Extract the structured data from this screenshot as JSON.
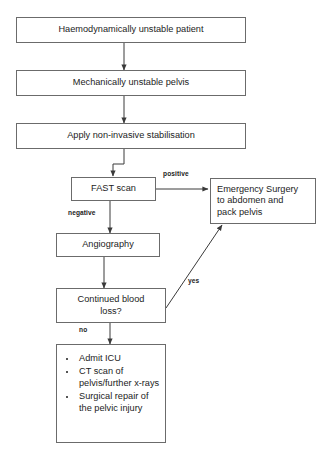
{
  "diagram": {
    "type": "flowchart",
    "colors": {
      "box_border": "#6b6b6b",
      "text": "#1c1c1c",
      "background": "#ffffff",
      "connector": "#3a3a3a"
    },
    "nodes": [
      {
        "id": "n1",
        "label": "Haemodynamically unstable patient"
      },
      {
        "id": "n2",
        "label": "Mechanically unstable pelvis"
      },
      {
        "id": "n3",
        "label": "Apply non-invasive stabilisation"
      },
      {
        "id": "n4",
        "label": "FAST scan"
      },
      {
        "id": "n5",
        "label": "Emergency Surgery to abdomen and pack pelvis"
      },
      {
        "id": "n6",
        "label": "Angiography"
      },
      {
        "id": "n7",
        "label": "Continued blood loss?"
      },
      {
        "id": "n8",
        "label": "Admit ICU / CT scan of pelvis/further x-rays / Surgical repair of the pelvic injury"
      }
    ],
    "emergency_surgery_lines": [
      "Emergency Surgery",
      "to abdomen and",
      "pack pelvis"
    ],
    "continued_blood_loss_lines": [
      "Continued blood",
      "loss?"
    ],
    "outcome_bullets": [
      "Admit ICU",
      "CT scan of pelvis/further x-rays",
      "Surgical repair of the pelvic injury"
    ],
    "edge_labels": {
      "positive": "positive",
      "negative": "negative",
      "yes": "yes",
      "no": "no"
    }
  }
}
